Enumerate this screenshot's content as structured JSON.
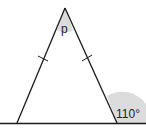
{
  "diagram": {
    "type": "isosceles-triangle",
    "apex_angle_label": "p",
    "exterior_angle_label": "110°",
    "equal_sides_marked": true,
    "colors": {
      "stroke": "#1a1a1a",
      "shade": "#d9d9d9",
      "background": "#ffffff"
    }
  }
}
